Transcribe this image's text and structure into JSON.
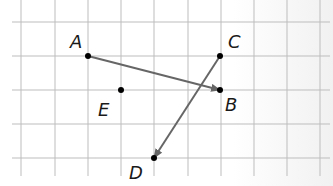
{
  "diagram": {
    "type": "coordinate-grid-vectors",
    "grid": {
      "cell_size_px": 33.4,
      "columns": 10,
      "rows": 5,
      "line_color": "#bdbdbd"
    },
    "points": [
      {
        "id": "A",
        "label": "A",
        "x": 88,
        "y": 56,
        "label_x": 70,
        "label_y": 48
      },
      {
        "id": "B",
        "label": "B",
        "x": 220,
        "y": 90,
        "label_x": 225,
        "label_y": 111
      },
      {
        "id": "C",
        "label": "C",
        "x": 220,
        "y": 56,
        "label_x": 228,
        "label_y": 48
      },
      {
        "id": "D",
        "label": "D",
        "x": 154,
        "y": 158,
        "label_x": 129,
        "label_y": 179
      },
      {
        "id": "E",
        "label": "E",
        "x": 121,
        "y": 90,
        "label_x": 98,
        "label_y": 116
      }
    ],
    "vectors": [
      {
        "from": "A",
        "to": "B",
        "color": "#666666"
      },
      {
        "from": "C",
        "to": "D",
        "color": "#666666"
      }
    ],
    "point_color": "#000000"
  }
}
